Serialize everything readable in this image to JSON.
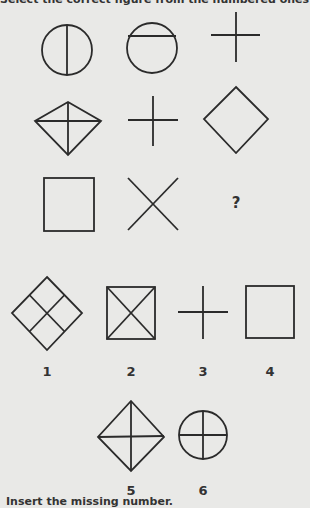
{
  "instruction_top": "Select the correct figure from the numbered ones",
  "instruction_bottom": "Insert the missing number.",
  "puzzle": {
    "grid": [
      [
        "circle-vertical-line",
        "circle-horizontal-line",
        "cross"
      ],
      [
        "diamond-with-cross",
        "cross",
        "diamond"
      ],
      [
        "square",
        "x-shape",
        "missing"
      ]
    ],
    "missing_marker": "?"
  },
  "options": [
    {
      "label": "1",
      "shape": "diamond-grid"
    },
    {
      "label": "2",
      "shape": "square-with-x"
    },
    {
      "label": "3",
      "shape": "cross"
    },
    {
      "label": "4",
      "shape": "square"
    },
    {
      "label": "5",
      "shape": "diamond-with-cross"
    },
    {
      "label": "6",
      "shape": "circle-with-cross"
    }
  ]
}
